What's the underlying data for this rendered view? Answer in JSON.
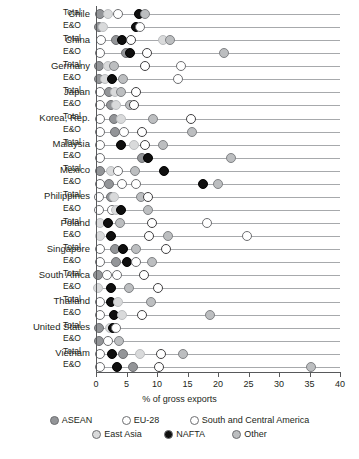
{
  "chart_data": {
    "type": "scatter",
    "title": "",
    "xlabel": "% of gross exports",
    "ylabel": "",
    "xlim": [
      0,
      40
    ],
    "xticks": [
      0,
      5,
      10,
      15,
      20,
      25,
      30,
      35,
      40
    ],
    "xtick_labels": [
      "0",
      "5",
      "10",
      "15",
      "20",
      "25",
      "30",
      "35",
      "40"
    ],
    "grid": false,
    "legend_position": "bottom",
    "series_names": [
      "ASEAN",
      "EU-28",
      "South and Central America",
      "East Asia",
      "NAFTA",
      "Other"
    ],
    "row_labels": [
      "Total",
      "E&O"
    ],
    "categories": [
      "Chile",
      "China",
      "Germany",
      "Japan",
      "Korea, Rep.",
      "Malaysia",
      "Mexico",
      "Philippines",
      "Poland",
      "Singapore",
      "South Africa",
      "Thailand",
      "United States",
      "Vietnam"
    ],
    "rows": [
      {
        "country": "Chile",
        "series": "Total",
        "points": [
          {
            "name": "ASEAN",
            "value": 0.6
          },
          {
            "name": "East Asia",
            "value": 1.9
          },
          {
            "name": "EU-28",
            "value": 3.6
          },
          {
            "name": "NAFTA",
            "value": 7.0
          },
          {
            "name": "Other",
            "value": 8.1
          }
        ]
      },
      {
        "country": "Chile",
        "series": "E&O",
        "points": [
          {
            "name": "ASEAN",
            "value": 0.5
          },
          {
            "name": "East Asia",
            "value": 1.1
          },
          {
            "name": "NAFTA",
            "value": 6.5
          },
          {
            "name": "EU-28",
            "value": 7.2
          }
        ]
      },
      {
        "country": "China",
        "series": "Total",
        "points": [
          {
            "name": "EU-28",
            "value": 0.8
          },
          {
            "name": "ASEAN",
            "value": 3.2
          },
          {
            "name": "NAFTA",
            "value": 4.2
          },
          {
            "name": "South and Central America",
            "value": 5.8
          },
          {
            "name": "East Asia",
            "value": 11.0
          },
          {
            "name": "Other",
            "value": 12.1
          }
        ]
      },
      {
        "country": "China",
        "series": "E&O",
        "points": [
          {
            "name": "EU-28",
            "value": 0.6
          },
          {
            "name": "ASEAN",
            "value": 4.9
          },
          {
            "name": "NAFTA",
            "value": 5.6
          },
          {
            "name": "South and Central America",
            "value": 8.4
          },
          {
            "name": "Other",
            "value": 21.0
          }
        ]
      },
      {
        "country": "Germany",
        "series": "Total",
        "points": [
          {
            "name": "ASEAN",
            "value": 0.5
          },
          {
            "name": "East Asia",
            "value": 1.9
          },
          {
            "name": "Other",
            "value": 2.9
          },
          {
            "name": "South and Central America",
            "value": 8.0
          },
          {
            "name": "EU-28",
            "value": 14.0
          }
        ]
      },
      {
        "country": "Germany",
        "series": "E&O",
        "points": [
          {
            "name": "ASEAN",
            "value": 0.5
          },
          {
            "name": "East Asia",
            "value": 1.4
          },
          {
            "name": "NAFTA",
            "value": 2.7
          },
          {
            "name": "Other",
            "value": 4.4
          },
          {
            "name": "EU-28",
            "value": 13.4
          }
        ]
      },
      {
        "country": "Japan",
        "series": "Total",
        "points": [
          {
            "name": "EU-28",
            "value": 0.6
          },
          {
            "name": "ASEAN",
            "value": 2.2
          },
          {
            "name": "East Asia",
            "value": 3.1
          },
          {
            "name": "Other",
            "value": 4.1
          },
          {
            "name": "South and Central America",
            "value": 6.6
          }
        ]
      },
      {
        "country": "Japan",
        "series": "E&O",
        "points": [
          {
            "name": "EU-28",
            "value": 0.6
          },
          {
            "name": "ASEAN",
            "value": 2.4
          },
          {
            "name": "East Asia",
            "value": 3.3
          },
          {
            "name": "Other",
            "value": 5.5
          },
          {
            "name": "South and Central America",
            "value": 6.3
          }
        ]
      },
      {
        "country": "Korea, Rep.",
        "series": "Total",
        "points": [
          {
            "name": "EU-28",
            "value": 0.6
          },
          {
            "name": "ASEAN",
            "value": 3.0
          },
          {
            "name": "East Asia",
            "value": 4.1
          },
          {
            "name": "Other",
            "value": 9.4
          },
          {
            "name": "South and Central America",
            "value": 15.5
          }
        ]
      },
      {
        "country": "Korea, Rep.",
        "series": "E&O",
        "points": [
          {
            "name": "EU-28",
            "value": 0.6
          },
          {
            "name": "ASEAN",
            "value": 3.1
          },
          {
            "name": "EU-28",
            "value": 4.6
          },
          {
            "name": "South and Central America",
            "value": 7.6
          },
          {
            "name": "Other",
            "value": 15.8
          }
        ]
      },
      {
        "country": "Malaysia",
        "series": "Total",
        "points": [
          {
            "name": "EU-28",
            "value": 0.6
          },
          {
            "name": "NAFTA",
            "value": 4.1
          },
          {
            "name": "East Asia",
            "value": 6.2
          },
          {
            "name": "South and Central America",
            "value": 8.1
          },
          {
            "name": "Other",
            "value": 11.0
          }
        ]
      },
      {
        "country": "Malaysia",
        "series": "E&O",
        "points": [
          {
            "name": "EU-28",
            "value": 0.6
          },
          {
            "name": "ASEAN",
            "value": 7.5
          },
          {
            "name": "NAFTA",
            "value": 8.6
          },
          {
            "name": "Other",
            "value": 22.2
          }
        ]
      },
      {
        "country": "Mexico",
        "series": "Total",
        "points": [
          {
            "name": "ASEAN",
            "value": 0.6
          },
          {
            "name": "East Asia",
            "value": 2.4
          },
          {
            "name": "EU-28",
            "value": 3.6
          },
          {
            "name": "Other",
            "value": 6.4
          },
          {
            "name": "NAFTA",
            "value": 11.1
          }
        ]
      },
      {
        "country": "Mexico",
        "series": "E&O",
        "points": [
          {
            "name": "EU-28",
            "value": 0.6
          },
          {
            "name": "ASEAN",
            "value": 2.2
          },
          {
            "name": "EU-28",
            "value": 4.3
          },
          {
            "name": "EU-28",
            "value": 6.5
          },
          {
            "name": "NAFTA",
            "value": 17.5
          },
          {
            "name": "Other",
            "value": 20.0
          }
        ]
      },
      {
        "country": "Philippines",
        "series": "Total",
        "points": [
          {
            "name": "EU-28",
            "value": 0.5
          },
          {
            "name": "ASEAN",
            "value": 2.5
          },
          {
            "name": "East Asia",
            "value": 2.9
          },
          {
            "name": "Other",
            "value": 7.4
          },
          {
            "name": "South and Central America",
            "value": 8.6
          }
        ]
      },
      {
        "country": "Philippines",
        "series": "E&O",
        "points": [
          {
            "name": "EU-28",
            "value": 0.5
          },
          {
            "name": "EU-28",
            "value": 2.6
          },
          {
            "name": "East Asia",
            "value": 3.3
          },
          {
            "name": "NAFTA",
            "value": 4.1
          },
          {
            "name": "Other",
            "value": 8.5
          }
        ]
      },
      {
        "country": "Poland",
        "series": "Total",
        "points": [
          {
            "name": "East Asia",
            "value": 0.6
          },
          {
            "name": "NAFTA",
            "value": 1.9
          },
          {
            "name": "Other",
            "value": 4.0
          },
          {
            "name": "South and Central America",
            "value": 9.1
          },
          {
            "name": "EU-28",
            "value": 18.2
          }
        ]
      },
      {
        "country": "Poland",
        "series": "E&O",
        "points": [
          {
            "name": "East Asia",
            "value": 0.6
          },
          {
            "name": "NAFTA",
            "value": 2.4
          },
          {
            "name": "South and Central America",
            "value": 8.7
          },
          {
            "name": "Other",
            "value": 11.8
          },
          {
            "name": "EU-28",
            "value": 24.8
          }
        ]
      },
      {
        "country": "Singapore",
        "series": "Total",
        "points": [
          {
            "name": "EU-28",
            "value": 0.6
          },
          {
            "name": "ASEAN",
            "value": 3.1
          },
          {
            "name": "NAFTA",
            "value": 4.5
          },
          {
            "name": "Other",
            "value": 6.5
          },
          {
            "name": "South and Central America",
            "value": 11.5
          }
        ]
      },
      {
        "country": "Singapore",
        "series": "E&O",
        "points": [
          {
            "name": "EU-28",
            "value": 0.6
          },
          {
            "name": "ASEAN",
            "value": 3.2
          },
          {
            "name": "NAFTA",
            "value": 5.1
          },
          {
            "name": "EU-28",
            "value": 6.6
          },
          {
            "name": "Other",
            "value": 9.2
          }
        ]
      },
      {
        "country": "South Africa",
        "series": "Total",
        "points": [
          {
            "name": "ASEAN",
            "value": 0.4
          },
          {
            "name": "EU-28",
            "value": 1.8
          },
          {
            "name": "EU-28",
            "value": 3.4
          },
          {
            "name": "South and Central America",
            "value": 7.9
          }
        ]
      },
      {
        "country": "South Africa",
        "series": "E&O",
        "points": [
          {
            "name": "East Asia",
            "value": 0.4
          },
          {
            "name": "NAFTA",
            "value": 2.4
          },
          {
            "name": "Other",
            "value": 5.4
          },
          {
            "name": "South and Central America",
            "value": 10.2
          }
        ]
      },
      {
        "country": "Thailand",
        "series": "Total",
        "points": [
          {
            "name": "EU-28",
            "value": 0.6
          },
          {
            "name": "NAFTA",
            "value": 2.4
          },
          {
            "name": "East Asia",
            "value": 3.6
          },
          {
            "name": "Other",
            "value": 9.0
          }
        ]
      },
      {
        "country": "Thailand",
        "series": "E&O",
        "points": [
          {
            "name": "EU-28",
            "value": 0.6
          },
          {
            "name": "NAFTA",
            "value": 2.9
          },
          {
            "name": "East Asia",
            "value": 4.2
          },
          {
            "name": "South and Central America",
            "value": 7.6
          },
          {
            "name": "Other",
            "value": 18.7
          }
        ]
      },
      {
        "country": "United States",
        "series": "Total",
        "points": [
          {
            "name": "ASEAN",
            "value": 0.5
          },
          {
            "name": "East Asia",
            "value": 2.3
          },
          {
            "name": "NAFTA",
            "value": 2.8
          },
          {
            "name": "EU-28",
            "value": 3.2
          }
        ]
      },
      {
        "country": "United States",
        "series": "E&O",
        "points": [
          {
            "name": "ASEAN",
            "value": 0.5
          },
          {
            "name": "EU-28",
            "value": 1.9
          },
          {
            "name": "Other",
            "value": 3.8
          }
        ]
      },
      {
        "country": "Vietnam",
        "series": "Total",
        "points": [
          {
            "name": "EU-28",
            "value": 0.6
          },
          {
            "name": "NAFTA",
            "value": 2.6
          },
          {
            "name": "ASEAN",
            "value": 4.4
          },
          {
            "name": "East Asia",
            "value": 7.2
          },
          {
            "name": "South and Central America",
            "value": 10.6
          },
          {
            "name": "Other",
            "value": 14.3
          }
        ]
      },
      {
        "country": "Vietnam",
        "series": "E&O",
        "points": [
          {
            "name": "EU-28",
            "value": 0.6
          },
          {
            "name": "NAFTA",
            "value": 3.4
          },
          {
            "name": "ASEAN",
            "value": 6.0
          },
          {
            "name": "South and Central America",
            "value": 10.3
          },
          {
            "name": "Other",
            "value": 35.3
          }
        ]
      }
    ]
  },
  "axis": {
    "title": "% of gross exports",
    "ticks": [
      "0",
      "5",
      "10",
      "15",
      "20",
      "25",
      "30",
      "35",
      "40"
    ]
  },
  "legend": {
    "items": [
      {
        "label": "ASEAN",
        "key": "asean"
      },
      {
        "label": "EU-28",
        "key": "eu"
      },
      {
        "label": "South and Central America",
        "key": "sca"
      },
      {
        "label": "East Asia",
        "key": "east"
      },
      {
        "label": "NAFTA",
        "key": "nafta"
      },
      {
        "label": "Other",
        "key": "other"
      }
    ]
  }
}
